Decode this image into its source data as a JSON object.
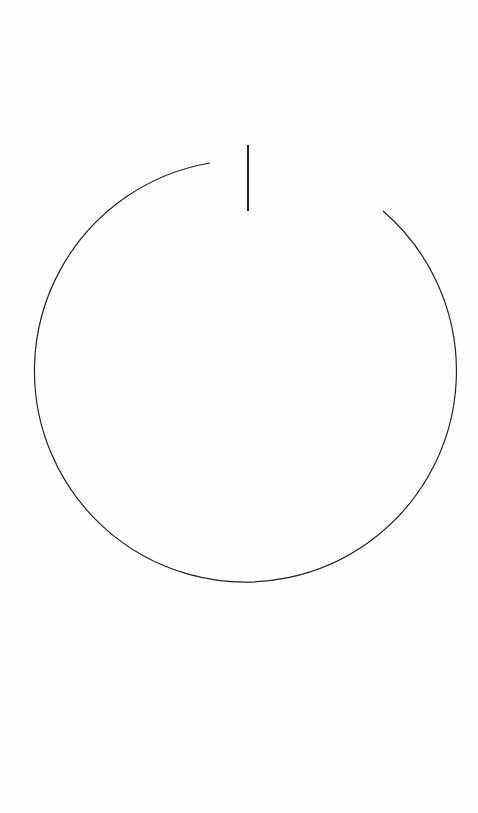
{
  "canvas": {
    "width": 478,
    "height": 813,
    "background": "#fefefe"
  },
  "drawing": {
    "icon": "power-icon",
    "stroke_color": "#222222",
    "arc": {
      "cx": 248,
      "cy": 376,
      "r": 211,
      "start": [
        210,
        163
      ],
      "end": [
        383,
        211
      ],
      "stroke_width": 1.2
    },
    "line": {
      "x": 248,
      "y1": 145,
      "y2": 211,
      "stroke_width": 2
    }
  }
}
